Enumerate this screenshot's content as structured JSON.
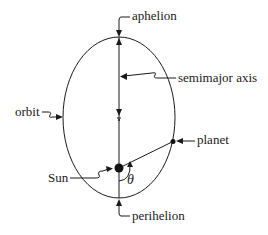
{
  "diagram": {
    "type": "orbital-ellipse",
    "labels": {
      "aphelion": "aphelion",
      "semimajor_axis": "semimajor axis",
      "orbit": "orbit",
      "planet": "planet",
      "sun": "Sun",
      "angle": "θ",
      "perihelion": "perihelion"
    },
    "colors": {
      "stroke": "#1a1a1a",
      "background": "#ffffff"
    }
  }
}
